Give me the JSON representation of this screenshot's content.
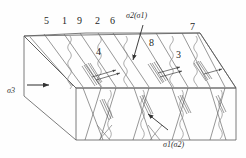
{
  "figure": {
    "type": "3d-block-fracture-diagram",
    "background_color": "#fefefe",
    "line_color": "#555555",
    "text_color": "#2b2b2b"
  },
  "stress_labels": {
    "left": {
      "text": "σ3",
      "sigma": "σ",
      "sub": "3",
      "x": 7,
      "y": 88
    },
    "top": {
      "text": "σ2(σ1)",
      "x": 126,
      "y": 13
    },
    "bottom_right": {
      "text": "σ1(σ2)",
      "x": 163,
      "y": 142
    }
  },
  "feature_numbers": [
    {
      "id": "5",
      "label": "5",
      "x": 44,
      "y": 21
    },
    {
      "id": "1",
      "label": "1",
      "x": 62,
      "y": 21
    },
    {
      "id": "9",
      "label": "9",
      "x": 77,
      "y": 21
    },
    {
      "id": "2",
      "label": "2",
      "x": 95,
      "y": 21
    },
    {
      "id": "6",
      "label": "6",
      "x": 110,
      "y": 21
    },
    {
      "id": "4",
      "label": "4",
      "x": 96,
      "y": 52
    },
    {
      "id": "8",
      "label": "8",
      "x": 149,
      "y": 43
    },
    {
      "id": "7",
      "label": "7",
      "x": 190,
      "y": 27
    },
    {
      "id": "3",
      "label": "3",
      "x": 176,
      "y": 55
    }
  ],
  "annotations": {
    "sigma2_arrow": "arrow pointing down-left into top face",
    "sigma3_arrow": "horizontal arrow pointing right at left face",
    "internal_arrow": "arrow pointing up-left at front face fracture"
  }
}
